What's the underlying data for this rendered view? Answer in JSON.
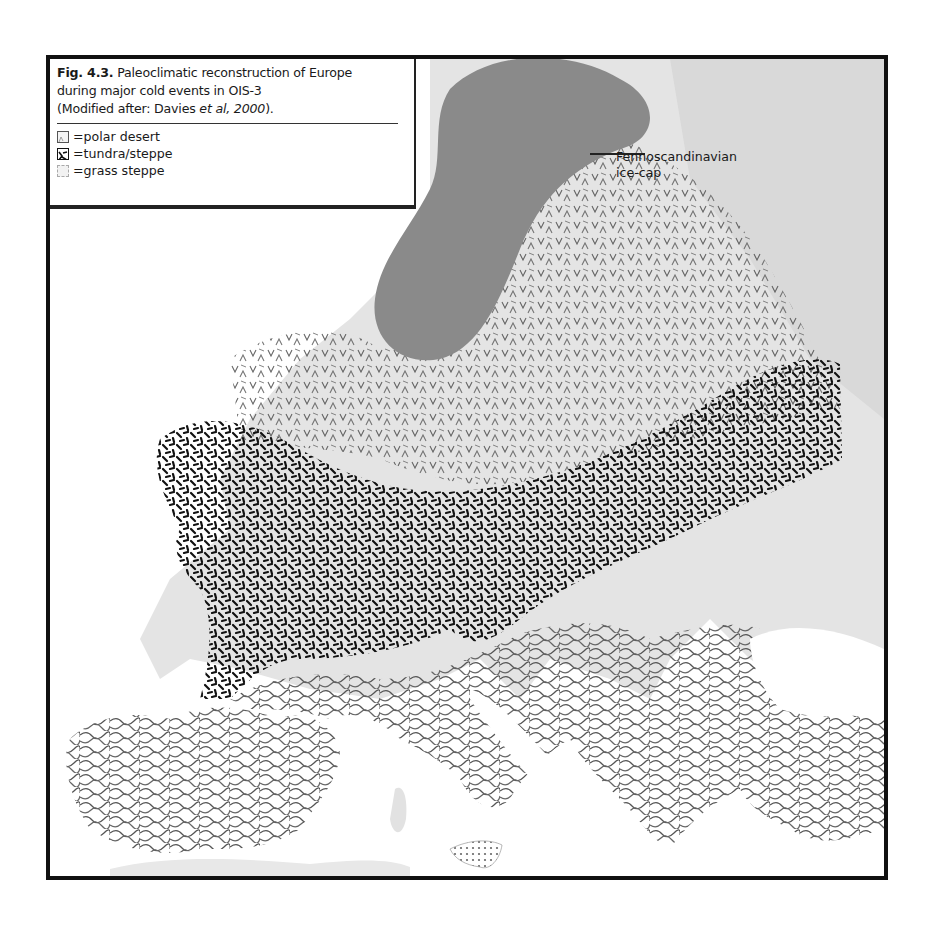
{
  "figure": {
    "number": "Fig. 4.3.",
    "title_text": "Paleoclimatic reconstruction of Europe",
    "title_line2": "during major cold events in OIS-3",
    "source_prefix": "(Modified after: Davies ",
    "source_italic": "et al, 2000",
    "source_suffix": ")."
  },
  "legend": {
    "items": [
      {
        "symbol": "polar-desert-swatch",
        "label": "=polar desert"
      },
      {
        "symbol": "tundra-steppe-swatch",
        "label": "=tundra/steppe"
      },
      {
        "symbol": "grass-steppe-swatch",
        "label": "=grass steppe"
      }
    ]
  },
  "annotations": {
    "icecap_line1": "Fennoscandinavian",
    "icecap_line2": "ice-cap"
  },
  "map": {
    "regions": [
      {
        "name": "fennoscandinavian-ice-cap",
        "fill": "#8a8a8a"
      },
      {
        "name": "polar-desert-zone",
        "pattern": "chevrons-light"
      },
      {
        "name": "tundra-steppe-zone",
        "pattern": "dense-black-dashes"
      },
      {
        "name": "southern-europe-zone",
        "pattern": "wavy-contours"
      },
      {
        "name": "sicily",
        "pattern": "dots"
      }
    ],
    "colors": {
      "land": "#e2e2e2",
      "sea": "#ffffff",
      "ice": "#8a8a8a",
      "ink": "#111111"
    }
  }
}
